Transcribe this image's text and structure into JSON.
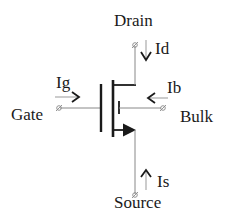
{
  "diagram": {
    "terminals": {
      "drain": {
        "label": "Drain",
        "current": "Id"
      },
      "gate": {
        "label": "Gate",
        "current": "Ig"
      },
      "bulk": {
        "label": "Bulk",
        "current": "Ib"
      },
      "source": {
        "label": "Source",
        "current": "Is"
      }
    },
    "colors": {
      "stroke": "#1a1a1a",
      "wire": "#777777",
      "background": "#ffffff"
    }
  }
}
